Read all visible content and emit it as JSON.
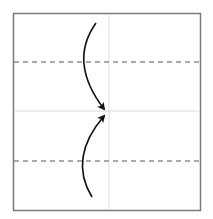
{
  "diagram": {
    "type": "origami-fold-step",
    "paper": {
      "x": 13,
      "y": 13,
      "width": 187,
      "height": 197,
      "border_color": "#7a7a7a",
      "fill": "#ffffff"
    },
    "creases": [
      {
        "id": "vertical-center-crease",
        "x1": 109,
        "y1": 13,
        "x2": 109,
        "y2": 210,
        "color": "#dddddd"
      },
      {
        "id": "horizontal-center-crease",
        "x1": 13,
        "y1": 111,
        "x2": 200,
        "y2": 111,
        "color": "#dddddd"
      }
    ],
    "valley_folds": [
      {
        "id": "top-valley-fold",
        "y": 62,
        "x1": 13,
        "x2": 200,
        "color": "#555555"
      },
      {
        "id": "bottom-valley-fold",
        "y": 161,
        "x1": 13,
        "x2": 200,
        "color": "#555555"
      }
    ],
    "arrows": [
      {
        "id": "top-fold-arrow",
        "path": "M96,23 Q68,62 104,109",
        "color": "#111111"
      },
      {
        "id": "bottom-fold-arrow",
        "path": "M92,197 Q68,158 104,116",
        "color": "#111111"
      }
    ]
  }
}
